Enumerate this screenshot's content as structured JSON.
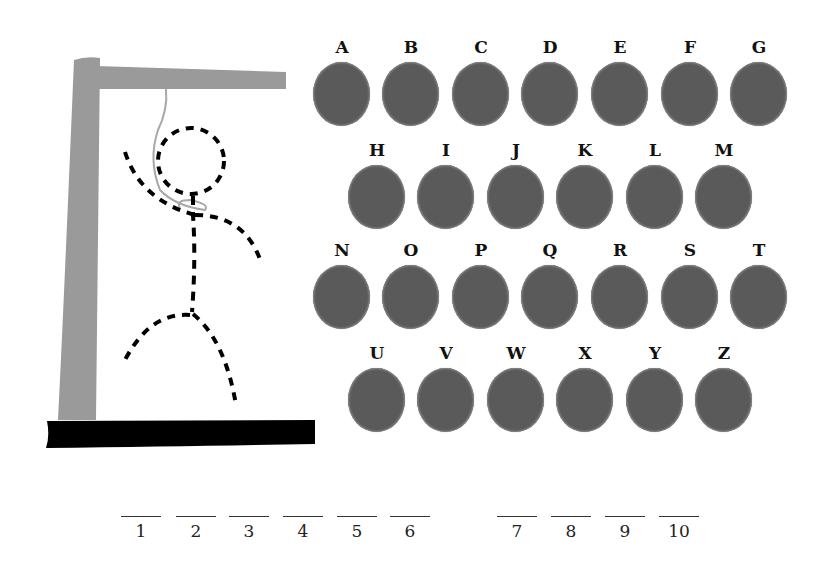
{
  "game": {
    "title": "Hangman",
    "colors": {
      "gallows_post": "#9a9a9a",
      "gallows_base": "#000000",
      "letter_disc": "#5a5a5a",
      "figure": "#000000"
    }
  },
  "letters": {
    "rows": [
      [
        "A",
        "B",
        "C",
        "D",
        "E",
        "F",
        "G"
      ],
      [
        "H",
        "I",
        "J",
        "K",
        "L",
        "M"
      ],
      [
        "N",
        "O",
        "P",
        "Q",
        "R",
        "S",
        "T"
      ],
      [
        "U",
        "V",
        "W",
        "X",
        "Y",
        "Z"
      ]
    ]
  },
  "word_slots": {
    "group1": [
      "1",
      "2",
      "3",
      "4",
      "5",
      "6"
    ],
    "group2": [
      "7",
      "8",
      "9",
      "10"
    ]
  },
  "figure": {
    "parts": [
      "head",
      "body",
      "left-arm",
      "right-arm",
      "left-leg",
      "right-leg"
    ],
    "style": "dashed"
  }
}
